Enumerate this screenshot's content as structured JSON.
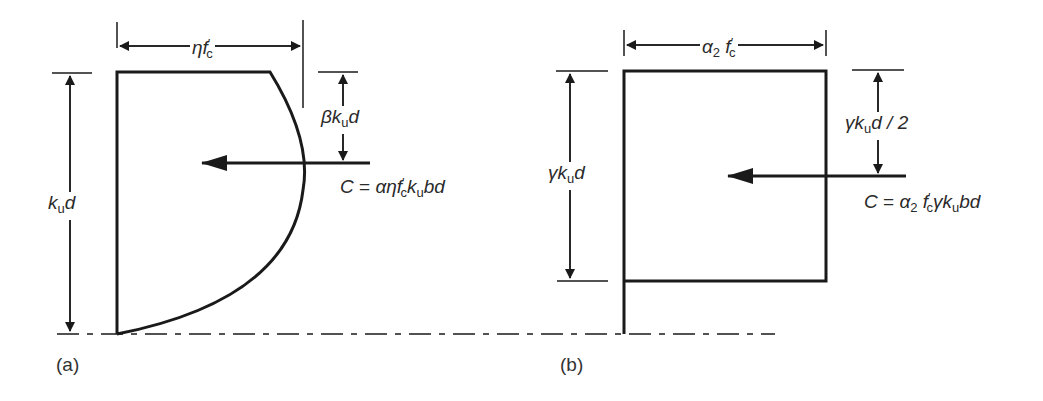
{
  "figure": {
    "panel_a": {
      "caption": "(a)",
      "description": "Parabolic-rectangular stress block",
      "labels": {
        "width_label": {
          "base": "ηf",
          "sub": "c",
          "sup": "′"
        },
        "depth_label": {
          "base": "k",
          "sub": "u",
          "tail": "d"
        },
        "centroid_label": {
          "pre": "β",
          "base": "k",
          "sub": "u",
          "tail": "d"
        },
        "force_label": {
          "lhs": "C",
          "eq": "=",
          "rhs_pre": "αηf",
          "sub1": "c",
          "sup1": "′",
          "mid": "k",
          "sub2": "u",
          "tail": "bd"
        }
      }
    },
    "panel_b": {
      "caption": "(b)",
      "description": "Equivalent rectangular stress block",
      "labels": {
        "width_label": {
          "base": "α",
          "sub0": "2",
          "mid": "f",
          "sub": "c",
          "sup": "′"
        },
        "depth_label": {
          "pre": "γ",
          "base": "k",
          "sub": "u",
          "tail": "d"
        },
        "centroid_label": {
          "pre": "γ",
          "base": "k",
          "sub": "u",
          "tail": "d / 2"
        },
        "force_label": {
          "lhs": "C",
          "eq": "=",
          "rhs_pre": "α",
          "sub0": "2",
          "mid": "f",
          "sub1": "c",
          "sup1": "′",
          "mid2": "γk",
          "sub2": "u",
          "tail": "bd"
        }
      }
    },
    "colors": {
      "line": "#1a1a1a",
      "text": "#2a2a2a",
      "background": "#ffffff"
    }
  }
}
